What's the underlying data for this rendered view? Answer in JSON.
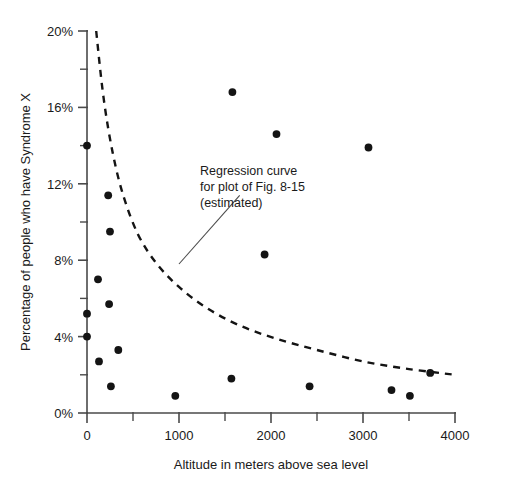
{
  "chart_data": {
    "type": "scatter",
    "title": "",
    "xlabel": "Altitude in meters above sea level",
    "ylabel": "Percentage of people who have Syndrome X",
    "xlim": [
      0,
      4000
    ],
    "ylim": [
      0,
      20
    ],
    "grid": false,
    "legend": "none",
    "x_ticks": [
      0,
      1000,
      2000,
      3000,
      4000
    ],
    "x_tick_labels": [
      "0",
      "1000",
      "2000",
      "3000",
      "4000"
    ],
    "x_minor_ticks": [
      500,
      1500,
      2500,
      3500
    ],
    "y_ticks": [
      0,
      4,
      8,
      12,
      16,
      20
    ],
    "y_tick_labels": [
      "0%",
      "4%",
      "8%",
      "12%",
      "16%",
      "20%"
    ],
    "y_minor_ticks": [
      2,
      6,
      10,
      14,
      18
    ],
    "points": [
      {
        "x": 0,
        "y": 14.0
      },
      {
        "x": 0,
        "y": 5.2
      },
      {
        "x": 0,
        "y": 4.0
      },
      {
        "x": 120,
        "y": 7.0
      },
      {
        "x": 130,
        "y": 2.7
      },
      {
        "x": 230,
        "y": 11.4
      },
      {
        "x": 240,
        "y": 5.7
      },
      {
        "x": 250,
        "y": 9.5
      },
      {
        "x": 260,
        "y": 1.4
      },
      {
        "x": 340,
        "y": 3.3
      },
      {
        "x": 960,
        "y": 0.9
      },
      {
        "x": 1570,
        "y": 1.8
      },
      {
        "x": 1580,
        "y": 16.8
      },
      {
        "x": 1930,
        "y": 8.3
      },
      {
        "x": 2060,
        "y": 14.6
      },
      {
        "x": 2420,
        "y": 1.4
      },
      {
        "x": 3060,
        "y": 13.9
      },
      {
        "x": 3310,
        "y": 1.2
      },
      {
        "x": 3510,
        "y": 0.9
      },
      {
        "x": 3730,
        "y": 2.1
      }
    ],
    "curve": {
      "name": "Regression curve (estimated)",
      "style": "dashed",
      "points": [
        {
          "x": 100,
          "y": 20.0
        },
        {
          "x": 180,
          "y": 16.5
        },
        {
          "x": 280,
          "y": 13.6
        },
        {
          "x": 400,
          "y": 11.3
        },
        {
          "x": 560,
          "y": 9.3
        },
        {
          "x": 760,
          "y": 7.8
        },
        {
          "x": 1000,
          "y": 6.6
        },
        {
          "x": 1300,
          "y": 5.5
        },
        {
          "x": 1650,
          "y": 4.6
        },
        {
          "x": 2050,
          "y": 3.9
        },
        {
          "x": 2500,
          "y": 3.3
        },
        {
          "x": 3000,
          "y": 2.7
        },
        {
          "x": 3500,
          "y": 2.3
        },
        {
          "x": 4000,
          "y": 2.0
        }
      ]
    },
    "annotation": {
      "lines": [
        "Regression curve",
        "for plot of Fig. 8-15",
        "(estimated)"
      ],
      "leader_from": {
        "x": 1000,
        "y": 7.8
      },
      "leader_to": {
        "x": 1660,
        "y": 11.4
      }
    },
    "colors": {
      "point": "#141414",
      "curve": "#141414",
      "axis": "#4a4a4a",
      "text": "#1a1a1a",
      "background": "#ffffff"
    }
  }
}
